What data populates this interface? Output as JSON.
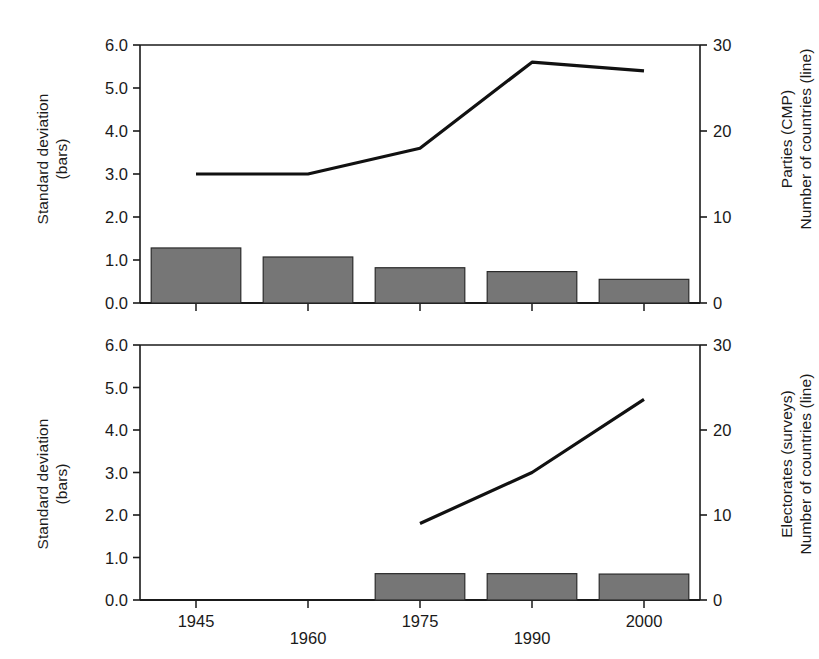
{
  "figure": {
    "background": "#ffffff",
    "bar_color": "#767676",
    "bar_edge_color": "#2b2b2b",
    "line_color": "#111111",
    "axis_color": "#1a1a1a"
  },
  "panels": [
    {
      "id": "top",
      "left_axis_title_line1": "Standard deviation",
      "left_axis_title_line2": "(bars)",
      "right_axis_title_line1": "Parties (CMP)",
      "right_axis_title_line2": "Number of countries (line)",
      "left_ticks": [
        "0.0",
        "1.0",
        "2.0",
        "3.0",
        "4.0",
        "5.0",
        "6.0"
      ],
      "right_ticks": [
        "0",
        "10",
        "20",
        "30"
      ],
      "x_ticks": [
        "1945",
        "1960",
        "1975",
        "1990",
        "2000"
      ]
    },
    {
      "id": "bottom",
      "left_axis_title_line1": "Standard deviation",
      "left_axis_title_line2": "(bars)",
      "right_axis_title_line1": "Electorates (surveys)",
      "right_axis_title_line2": "Number of countries (line)",
      "left_ticks": [
        "0.0",
        "1.0",
        "2.0",
        "3.0",
        "4.0",
        "5.0",
        "6.0"
      ],
      "right_ticks": [
        "0",
        "10",
        "20",
        "30"
      ],
      "x_ticks": [
        "1945",
        "1960",
        "1975",
        "1990",
        "2000"
      ]
    }
  ],
  "chart_data": [
    {
      "type": "bar",
      "panel": "top",
      "title": "",
      "categories": [
        "1945",
        "1960",
        "1975",
        "1990",
        "2000"
      ],
      "xlabel": "",
      "ylabel": "Standard deviation (bars)",
      "ylim": [
        0.0,
        6.0
      ],
      "y2label": "Parties (CMP) Number of countries (line)",
      "y2lim": [
        0,
        30
      ],
      "grid": false,
      "legend": "none",
      "series": [
        {
          "name": "Standard deviation (bars)",
          "kind": "bar",
          "axis": "left",
          "values": [
            1.28,
            1.07,
            0.82,
            0.73,
            0.55
          ]
        },
        {
          "name": "Number of countries (line)",
          "kind": "line",
          "axis": "right",
          "values": [
            15,
            15,
            18,
            28,
            27
          ]
        }
      ]
    },
    {
      "type": "bar",
      "panel": "bottom",
      "title": "",
      "categories": [
        "1945",
        "1960",
        "1975",
        "1990",
        "2000"
      ],
      "xlabel": "",
      "ylabel": "Standard deviation (bars)",
      "ylim": [
        0.0,
        6.0
      ],
      "y2label": "Electorates (surveys) Number of countries (line)",
      "y2lim": [
        0,
        30
      ],
      "grid": false,
      "legend": "none",
      "series": [
        {
          "name": "Standard deviation (bars)",
          "kind": "bar",
          "axis": "left",
          "values": [
            null,
            null,
            0.62,
            0.62,
            0.61
          ]
        },
        {
          "name": "Number of countries (line)",
          "kind": "line",
          "axis": "right",
          "values": [
            null,
            null,
            9,
            15,
            23.6
          ]
        }
      ]
    }
  ]
}
